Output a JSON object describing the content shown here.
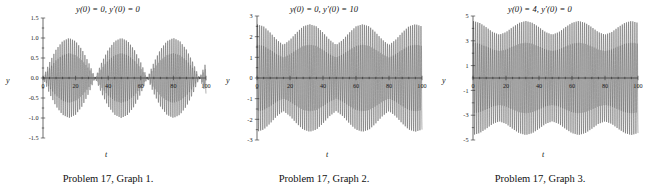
{
  "figure": {
    "panels": [
      {
        "id": "graph-1",
        "title": "y(0) = 0, y′(0) = 0",
        "title_parts": {
          "y0": "y(0) = 0",
          "yp0": "y′(0) = 0"
        },
        "caption": "Problem 17, Graph 1.",
        "xlabel": "t",
        "ylabel": "y"
      },
      {
        "id": "graph-2",
        "title": "y(0) = 0, y′(0) = 10",
        "title_parts": {
          "y0": "y(0) = 0",
          "yp0": "y′(0) = 10"
        },
        "caption": "Problem 17, Graph 2.",
        "xlabel": "t",
        "ylabel": "y"
      },
      {
        "id": "graph-3",
        "title": "y(0) = 4, y′(0) = 0",
        "title_parts": {
          "y0": "y(0) = 4",
          "yp0": "y′(0) = 0"
        },
        "caption": "Problem 17, Graph 3.",
        "xlabel": "t",
        "ylabel": "y"
      }
    ]
  },
  "chart_data": [
    {
      "type": "line",
      "title": "y(0) = 0, y′(0) = 0",
      "caption": "Problem 17, Graph 1.",
      "xlabel": "t",
      "ylabel": "y",
      "xlim": [
        0,
        100
      ],
      "ylim": [
        -1.5,
        1.5
      ],
      "xticks": [
        0,
        20,
        40,
        60,
        80,
        100
      ],
      "xticklabels": [
        "0",
        "20",
        "40",
        "60",
        "80",
        "100"
      ],
      "yticks": [
        -1.5,
        -1.0,
        -0.5,
        0.0,
        0.5,
        1.0,
        1.5
      ],
      "yticklabels": [
        "-1.5",
        "-1.0",
        "-0.5",
        "0.0",
        "0.5",
        "1.0",
        "1.5"
      ],
      "minor_xticks": 5,
      "grid": false,
      "legend": false,
      "description": "Beat pattern: amplitude-modulated oscillation, envelope repeatedly swells to ±1.0 and collapses to near 0. Three full beat packets across t = 0 to 100 with nodes near t = 32, 64, 96.",
      "model": {
        "envelope_amplitude": 1.0,
        "envelope_min": 0.0,
        "beat_period": 32,
        "carrier_period": 1.27,
        "initial_conditions": {
          "y0": 0,
          "yprime0": 0
        }
      },
      "series": [
        {
          "name": "y(t)",
          "color": "#141414",
          "amplitude_envelope": {
            "t": [
              0,
              4,
              8,
              12,
              16,
              20,
              24,
              28,
              32,
              36,
              40,
              44,
              48,
              52,
              56,
              60,
              64,
              68,
              72,
              76,
              80,
              84,
              88,
              92,
              96,
              100
            ],
            "a": [
              0.0,
              0.39,
              0.71,
              0.92,
              1.0,
              0.92,
              0.71,
              0.39,
              0.0,
              0.39,
              0.71,
              0.92,
              1.0,
              0.92,
              0.71,
              0.39,
              0.0,
              0.39,
              0.71,
              0.92,
              1.0,
              0.92,
              0.71,
              0.39,
              0.0,
              0.39
            ]
          }
        }
      ]
    },
    {
      "type": "line",
      "title": "y(0) = 0, y′(0) = 10",
      "caption": "Problem 17, Graph 2.",
      "xlabel": "t",
      "ylabel": "y",
      "xlim": [
        0,
        100
      ],
      "ylim": [
        -3,
        3
      ],
      "xticks": [
        0,
        20,
        40,
        60,
        80,
        100
      ],
      "xticklabels": [
        "0",
        "20",
        "40",
        "60",
        "80",
        "100"
      ],
      "yticks": [
        -3,
        -2,
        -1,
        0,
        1,
        2,
        3
      ],
      "yticklabels": [
        "-3",
        "-2",
        "-1",
        "0",
        "1",
        "2",
        "3"
      ],
      "minor_xticks": 5,
      "grid": false,
      "legend": false,
      "description": "Amplitude-modulated oscillation whose envelope oscillates between about ±1.6 and ±2.6; beats never collapse to zero because of the nonzero initial velocity.",
      "model": {
        "envelope_max": 2.6,
        "envelope_min": 1.6,
        "beat_period": 32,
        "carrier_period": 1.27,
        "initial_conditions": {
          "y0": 0,
          "yprime0": 10
        }
      },
      "series": [
        {
          "name": "y(t)",
          "color": "#141414",
          "amplitude_envelope": {
            "t": [
              0,
              4,
              8,
              12,
              16,
              20,
              24,
              28,
              32,
              36,
              40,
              44,
              48,
              52,
              56,
              60,
              64,
              68,
              72,
              76,
              80,
              84,
              88,
              92,
              96,
              100
            ],
            "a": [
              2.6,
              2.5,
              2.2,
              1.85,
              1.6,
              1.85,
              2.2,
              2.5,
              2.6,
              2.5,
              2.2,
              1.85,
              1.6,
              1.85,
              2.2,
              2.5,
              2.6,
              2.5,
              2.2,
              1.85,
              1.6,
              1.85,
              2.2,
              2.5,
              2.6,
              2.5
            ]
          }
        }
      ]
    },
    {
      "type": "line",
      "title": "y(0) = 4, y′(0) = 0",
      "caption": "Problem 17, Graph 3.",
      "xlabel": "t",
      "ylabel": "y",
      "xlim": [
        0,
        100
      ],
      "ylim": [
        -5,
        5
      ],
      "xticks": [
        0,
        20,
        40,
        60,
        80,
        100
      ],
      "xticklabels": [
        "0",
        "20",
        "40",
        "60",
        "80",
        "100"
      ],
      "yticks": [
        -5,
        -3,
        -1,
        1,
        3,
        5
      ],
      "yticklabels": [
        "-5",
        "-3",
        "-1",
        "1",
        "3",
        "5"
      ],
      "minor_xticks": 5,
      "grid": false,
      "legend": false,
      "description": "Amplitude-modulated oscillation whose envelope swells between about ±3.5 and ±4.6; the nonzero initial displacement keeps the beats from reaching zero.",
      "model": {
        "envelope_max": 4.6,
        "envelope_min": 3.5,
        "beat_period": 32,
        "carrier_period": 1.27,
        "initial_conditions": {
          "y0": 4,
          "yprime0": 0
        }
      },
      "series": [
        {
          "name": "y(t)",
          "color": "#141414",
          "amplitude_envelope": {
            "t": [
              0,
              4,
              8,
              12,
              16,
              20,
              24,
              28,
              32,
              36,
              40,
              44,
              48,
              52,
              56,
              60,
              64,
              68,
              72,
              76,
              80,
              84,
              88,
              92,
              96,
              100
            ],
            "a": [
              4.6,
              4.45,
              4.1,
              3.7,
              3.5,
              3.7,
              4.1,
              4.45,
              4.6,
              4.45,
              4.1,
              3.7,
              3.5,
              3.7,
              4.1,
              4.45,
              4.6,
              4.45,
              4.1,
              3.7,
              3.5,
              3.7,
              4.1,
              4.45,
              4.6,
              4.45
            ]
          }
        }
      ]
    }
  ]
}
